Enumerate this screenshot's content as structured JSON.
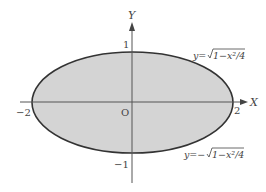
{
  "diagram": {
    "axes": {
      "x_label": "X",
      "y_label": "Y",
      "origin_label": "O"
    },
    "ticks": {
      "x_neg": "−2",
      "x_pos": "2",
      "y_pos": "1",
      "y_neg": "−1"
    },
    "curves": {
      "upper": "y=√1−x²/4",
      "lower": "y=−√1−x²/4",
      "upper_prefix": "y=",
      "upper_body": "1−x²/4",
      "lower_prefix": "y=−",
      "lower_body": "1−x²/4"
    },
    "colors": {
      "fill": "#d3d3d3",
      "stroke": "#333333",
      "axis": "#555555"
    }
  }
}
